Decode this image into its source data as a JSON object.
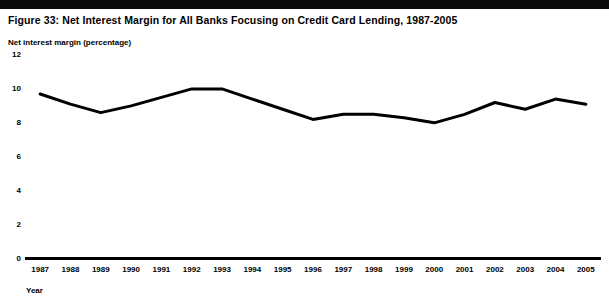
{
  "figure": {
    "title": "Figure 33:  Net Interest Margin for All Banks Focusing on Credit Card Lending, 1987-2005"
  },
  "chart_data": {
    "type": "line",
    "title": "Figure 33:  Net Interest Margin for All Banks Focusing on Credit Card Lending, 1987-2005",
    "xlabel": "Year",
    "ylabel": "Net interest margin (percentage)",
    "categories": [
      "1987",
      "1988",
      "1989",
      "1990",
      "1991",
      "1992",
      "1993",
      "1994",
      "1995",
      "1996",
      "1997",
      "1998",
      "1999",
      "2000",
      "2001",
      "2002",
      "2003",
      "2004",
      "2005"
    ],
    "values": [
      9.7,
      9.1,
      8.6,
      9.0,
      9.5,
      10.0,
      10.0,
      9.4,
      8.8,
      8.2,
      8.5,
      8.5,
      8.3,
      8.0,
      8.5,
      9.2,
      8.8,
      9.4,
      9.1
    ],
    "series": [
      {
        "name": "Net interest margin",
        "values": [
          9.7,
          9.1,
          8.6,
          9.0,
          9.5,
          10.0,
          10.0,
          9.4,
          8.8,
          8.2,
          8.5,
          8.5,
          8.3,
          8.0,
          8.5,
          9.2,
          8.8,
          9.4,
          9.1
        ]
      }
    ],
    "ylim": [
      0,
      12
    ],
    "yticks": [
      0,
      2,
      4,
      6,
      8,
      10,
      12
    ],
    "ytick_labels": [
      "0",
      "2",
      "4",
      "6",
      "8",
      "10",
      "12"
    ],
    "grid": false,
    "legend": "none",
    "line_color": "#000000",
    "line_width": 3
  }
}
